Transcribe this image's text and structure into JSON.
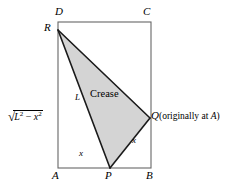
{
  "figure": {
    "type": "geometry-diagram",
    "colors": {
      "stroke": "#1a1a1a",
      "rect_stroke": "#555555",
      "fill": "#d4d4d4",
      "background": "#ffffff",
      "text": "#000000"
    },
    "rectangle": {
      "name": "ABCD",
      "left": 58,
      "right": 151,
      "top": 22,
      "bottom": 168,
      "corners": [
        {
          "label": "D",
          "x": 58,
          "y": 22,
          "label_x": 56,
          "label_y": 8
        },
        {
          "label": "C",
          "x": 151,
          "y": 22,
          "label_x": 145,
          "label_y": 8
        },
        {
          "label": "B",
          "x": 151,
          "y": 168,
          "label_x": 147,
          "label_y": 172
        },
        {
          "label": "A",
          "x": 58,
          "y": 168,
          "label_x": 53,
          "label_y": 172
        }
      ]
    },
    "crease_triangle": {
      "fill": "#d4d4d4",
      "points": [
        {
          "label": "R",
          "x": 58,
          "y": 30,
          "label_x": 45,
          "label_y": 24
        },
        {
          "label": "Q",
          "x": 150,
          "y": 118,
          "label_x": 152,
          "label_y": 112
        },
        {
          "label": "P",
          "x": 110,
          "y": 168,
          "label_x": 106,
          "label_y": 172
        }
      ]
    },
    "labels": {
      "crease": "Crease",
      "side_L": "L",
      "x_bottom": "x",
      "x_slant": "x",
      "q_note": "(originally at A)",
      "q_note_plain_prefix": "(originally at ",
      "q_note_italic": "A",
      "q_note_suffix": ")",
      "radical": {
        "sqrt_sign": "√",
        "base1": "L",
        "exp1": "2",
        "operator": " − ",
        "base2": "x",
        "exp2": "2",
        "full_text": "√(L² − x²)"
      }
    },
    "label_positions": {
      "crease": {
        "x": 92,
        "y": 94
      },
      "side_L": {
        "x": 76,
        "y": 98
      },
      "x_bottom": {
        "x": 80,
        "y": 153
      },
      "x_slant": {
        "x": 133,
        "y": 140
      },
      "q_label": {
        "x": 152,
        "y": 112
      },
      "q_note": {
        "x": 160,
        "y": 113
      },
      "radical": {
        "x": 7,
        "y": 110
      }
    }
  }
}
